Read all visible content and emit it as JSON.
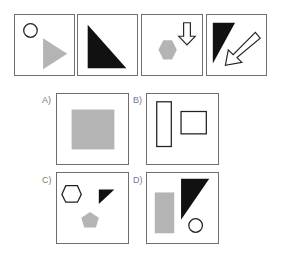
{
  "question": {
    "sequence": [
      {
        "id": "seq-1",
        "shapes": [
          "outline-circle",
          "gray-triangle-right"
        ]
      },
      {
        "id": "seq-2",
        "shapes": [
          "black-right-triangle"
        ]
      },
      {
        "id": "seq-3",
        "shapes": [
          "gray-hexagon",
          "outline-arrow-down"
        ]
      },
      {
        "id": "seq-4",
        "shapes": [
          "black-triangle",
          "outline-arrow-down-left"
        ]
      }
    ]
  },
  "options": [
    {
      "label": "A)",
      "shapes": [
        "gray-square"
      ]
    },
    {
      "label": "B)",
      "shapes": [
        "outline-tall-rectangle",
        "outline-rectangle"
      ]
    },
    {
      "label": "C)",
      "shapes": [
        "outline-hexagon",
        "black-triangle",
        "gray-pentagon"
      ]
    },
    {
      "label": "D)",
      "shapes": [
        "gray-rectangle",
        "black-triangle",
        "outline-circle"
      ]
    }
  ],
  "colors": {
    "border": "#6e6e6e",
    "gray": "#b4b4b4",
    "black": "#111111",
    "outline": "#222222"
  }
}
